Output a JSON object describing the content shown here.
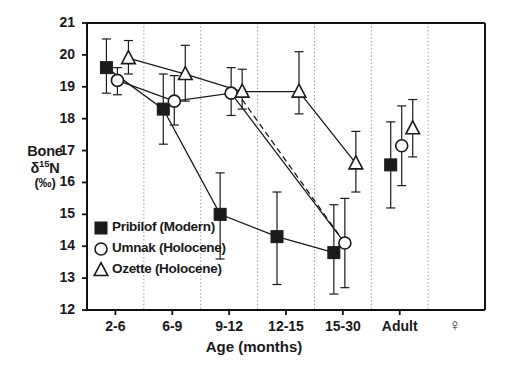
{
  "chart_data": {
    "type": "line",
    "title": "",
    "xlabel": "Age (months)",
    "ylabel": "Bone δ¹15N (‰)",
    "ylabel_lines": [
      "Bone",
      "δ15N",
      "(‰)"
    ],
    "categories": [
      "2-6",
      "6-9",
      "9-12",
      "12-15",
      "15-30",
      "Adult"
    ],
    "extra_xtick": "♀",
    "ylim": [
      12,
      21
    ],
    "yticks": [
      12,
      13,
      14,
      15,
      16,
      17,
      18,
      19,
      20,
      21
    ],
    "grid": "vertical-dotted-between-categories",
    "legend_position": "inside-lower-left",
    "series": [
      {
        "name": "Pribilof (Modern)",
        "marker": "filled-square",
        "line": "solid",
        "values": [
          19.6,
          18.3,
          15.0,
          14.3,
          13.8,
          16.55
        ],
        "err_low": [
          18.8,
          17.2,
          13.6,
          12.8,
          12.5,
          15.2
        ],
        "err_high": [
          20.5,
          19.4,
          16.3,
          15.7,
          15.3,
          17.9
        ]
      },
      {
        "name": "Umnak (Holocene)",
        "marker": "open-circle",
        "line": "solid",
        "values": [
          19.2,
          18.55,
          18.8,
          null,
          14.1,
          17.15
        ],
        "err_low": [
          18.75,
          17.8,
          18.1,
          null,
          12.7,
          15.9
        ],
        "err_high": [
          19.6,
          19.35,
          19.6,
          null,
          15.5,
          18.4
        ]
      },
      {
        "name": "Ozette (Holocene)",
        "marker": "open-triangle",
        "line": "solid",
        "values": [
          19.9,
          19.4,
          18.85,
          18.85,
          16.6,
          17.7
        ],
        "err_low": [
          19.4,
          18.55,
          18.3,
          18.15,
          15.7,
          16.8
        ],
        "err_high": [
          20.45,
          20.3,
          19.55,
          20.1,
          17.6,
          18.6
        ]
      }
    ],
    "dashed_connector": {
      "note": "dashed line from Ozette 9-12 to Umnak 15-30",
      "from": {
        "category": "9-12",
        "value": 18.6
      },
      "to": {
        "category": "15-30",
        "value": 14.1
      }
    }
  },
  "legend": {
    "items": [
      {
        "label": "Pribilof (Modern)",
        "marker": "filled-square"
      },
      {
        "label": "Umnak (Holocene)",
        "marker": "open-circle"
      },
      {
        "label": "Ozette (Holocene)",
        "marker": "open-triangle"
      }
    ]
  },
  "colors": {
    "axis": "#111111",
    "marker": "#1a1a1a",
    "grid": "#999999",
    "background": "#ffffff"
  }
}
